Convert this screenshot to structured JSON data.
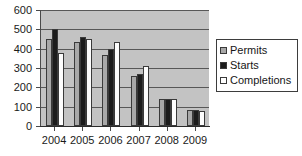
{
  "chart_data": {
    "type": "bar",
    "title": "",
    "xlabel": "",
    "ylabel": "",
    "categories": [
      "2004",
      "2005",
      "2006",
      "2007",
      "2008",
      "2009"
    ],
    "series": [
      {
        "name": "Permits",
        "color": "#a8a8a8",
        "values": [
          450,
          435,
          368,
          258,
          138,
          85
        ]
      },
      {
        "name": "Starts",
        "color": "#1c1c1c",
        "values": [
          500,
          460,
          398,
          268,
          138,
          85
        ]
      },
      {
        "name": "Completions",
        "color": "#ffffff",
        "values": [
          380,
          448,
          432,
          312,
          138,
          80
        ]
      }
    ],
    "ylim": [
      0,
      600
    ],
    "ytick_labels": [
      "600",
      "500",
      "400",
      "300",
      "200",
      "100",
      "0"
    ],
    "ytick_values": [
      600,
      500,
      400,
      300,
      200,
      100,
      0
    ],
    "grid": true,
    "legend_position": "right",
    "plot_background": "#c3c3c3",
    "figure_background": "#ffffff"
  },
  "legend": {
    "items": [
      {
        "label": "Permits"
      },
      {
        "label": "Starts"
      },
      {
        "label": "Completions"
      }
    ]
  }
}
